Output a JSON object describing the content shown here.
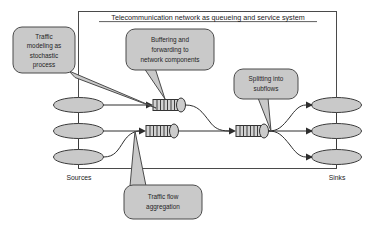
{
  "diagram": {
    "title": "Telecommunication network as queueing and service system",
    "labels": {
      "sources": "Sources",
      "sinks": "Sinks"
    },
    "callouts": [
      {
        "id": "traffic-modeling",
        "lines": [
          "Traffic",
          "modeling as",
          "stochastic",
          "process"
        ]
      },
      {
        "id": "buffering-forwarding",
        "lines": [
          "Buffering and",
          "forwarding to",
          "network components"
        ]
      },
      {
        "id": "splitting-subflows",
        "lines": [
          "Splitting into",
          "subflows"
        ]
      },
      {
        "id": "traffic-flow-aggregation",
        "lines": [
          "Traffic flow",
          "aggregation"
        ]
      }
    ],
    "nodes": {
      "sources": [
        "source-1",
        "source-2",
        "source-3"
      ],
      "sinks": [
        "sink-1",
        "sink-2",
        "sink-3"
      ],
      "queues": [
        "queue-1",
        "queue-2",
        "queue-3"
      ]
    },
    "colors": {
      "node_fill": "#c9c9c9",
      "stroke": "#3b3b3b",
      "frame_stroke": "#4a4a4a",
      "text": "#1a1a1a",
      "background": "#ffffff"
    }
  }
}
